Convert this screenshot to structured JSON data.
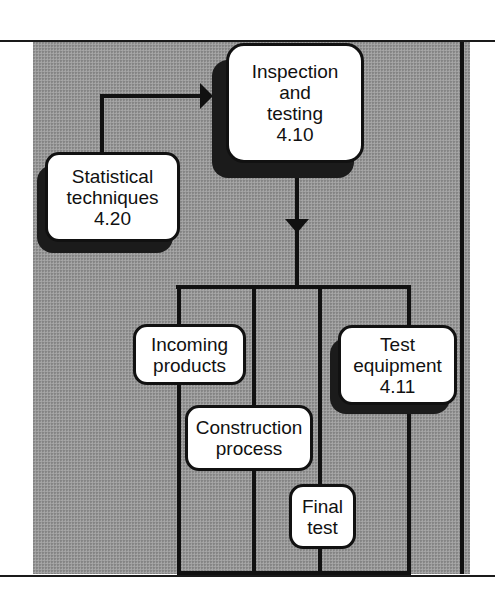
{
  "diagram": {
    "type": "flowchart",
    "nodes": {
      "inspection": {
        "lines": [
          "Inspection",
          "and",
          "testing",
          "4.10"
        ],
        "shadow": true
      },
      "statistical": {
        "lines": [
          "Statistical",
          "techniques",
          "4.20"
        ],
        "shadow": true
      },
      "incoming": {
        "lines": [
          "Incoming",
          "products"
        ],
        "shadow": false
      },
      "construction": {
        "lines": [
          "Construction",
          "process"
        ],
        "shadow": false
      },
      "final": {
        "lines": [
          "Final",
          "test"
        ],
        "shadow": false
      },
      "equipment": {
        "lines": [
          "Test",
          "equipment",
          "4.11"
        ],
        "shadow": true
      }
    },
    "edges": [
      {
        "from": "Statistical techniques 4.20",
        "to": "Inspection and testing 4.10",
        "arrow": "right"
      },
      {
        "from": "Inspection and testing 4.10",
        "to": [
          "Incoming products",
          "Construction process",
          "Final test",
          "Test equipment 4.11"
        ],
        "arrow": "down"
      }
    ],
    "colors": {
      "background": "#9a9a9a",
      "node_fill": "#ffffff",
      "stroke": "#111111"
    }
  }
}
